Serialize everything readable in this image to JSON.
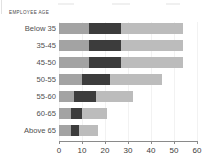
{
  "axis_title": "EMPLOYEE AGE",
  "chart_data": {
    "type": "bar",
    "orientation": "horizontal",
    "stacked": true,
    "title": "",
    "subtitle": "",
    "xlabel": "",
    "ylabel": "EMPLOYEE AGE",
    "xlim": [
      0,
      60
    ],
    "ylim": null,
    "grid": false,
    "legend": null,
    "xticks": [
      0,
      10,
      20,
      30,
      40,
      50,
      60
    ],
    "xtick_labels": [
      "0",
      "10",
      "20",
      "30",
      "40",
      "50",
      "60"
    ],
    "categories": [
      "Below 35",
      "35-45",
      "45-50",
      "50-55",
      "55-60",
      "60-65",
      "Above 65"
    ],
    "series": [
      {
        "name": "segment-1",
        "color": "#a3a3a3",
        "values": [
          13,
          13,
          13,
          10,
          6.5,
          5,
          5
        ]
      },
      {
        "name": "segment-2",
        "color": "#3c3c3c",
        "values": [
          14,
          14,
          14,
          12,
          9.5,
          5,
          3.5
        ]
      },
      {
        "name": "segment-3",
        "color": "#bcbcbc",
        "values": [
          27,
          27,
          27,
          23,
          16,
          11,
          8.5
        ]
      }
    ],
    "totals": [
      54,
      54,
      54,
      45,
      32,
      21,
      17
    ]
  },
  "colors": {
    "segment_1": "#a3a3a3",
    "segment_2": "#3c3c3c",
    "segment_3": "#bcbcbc",
    "axis": "#8a8a8a",
    "text": "#3d3d3d",
    "background": "#ffffff"
  }
}
